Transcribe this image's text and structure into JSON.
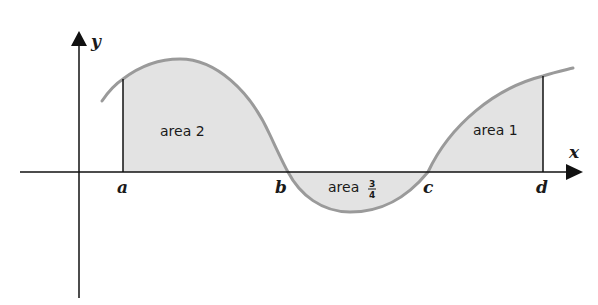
{
  "diagram": {
    "type": "area-under-curve",
    "colors": {
      "curve": "#9a9a9a",
      "fill": "#e3e3e3",
      "axes": "#111111",
      "text": "#1a1a1a"
    },
    "axes": {
      "x_label": "x",
      "y_label": "y"
    },
    "points": {
      "a": "a",
      "b": "b",
      "c": "c",
      "d": "d"
    },
    "regions": {
      "area2": "area 2",
      "area3_prefix": "area",
      "area3_num": "3",
      "area3_den": "4",
      "area1": "area 1"
    }
  }
}
